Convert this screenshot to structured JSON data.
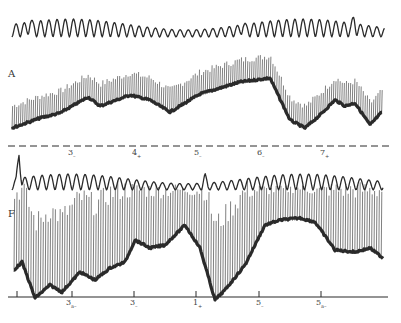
{
  "figure": {
    "panels": [
      {
        "id": "A",
        "label": "A",
        "traces": [
          "respiration",
          "blood-pressure"
        ]
      },
      {
        "id": "F",
        "label": "F",
        "traces": [
          "respiration",
          "blood-pressure"
        ]
      }
    ],
    "top_markers": [
      {
        "text": "3",
        "sub": "–",
        "x": 68
      },
      {
        "text": "4",
        "sub": "+",
        "x": 132
      },
      {
        "text": "5",
        "sub": "–",
        "x": 194
      },
      {
        "text": "6",
        "sub": "–",
        "x": 257
      },
      {
        "text": "7",
        "sub": "+",
        "x": 320
      }
    ],
    "bottom_markers": [
      {
        "text": "3",
        "sub": "a–",
        "x": 66
      },
      {
        "text": "3",
        "sub": "–",
        "x": 130
      },
      {
        "text": "1",
        "sub": "+",
        "x": 193
      },
      {
        "text": "5",
        "sub": "–",
        "x": 256
      },
      {
        "text": "5",
        "sub": "a–",
        "x": 316
      }
    ],
    "colors": {
      "ink": "#2a2a2a",
      "paper": "#ffffff"
    }
  }
}
